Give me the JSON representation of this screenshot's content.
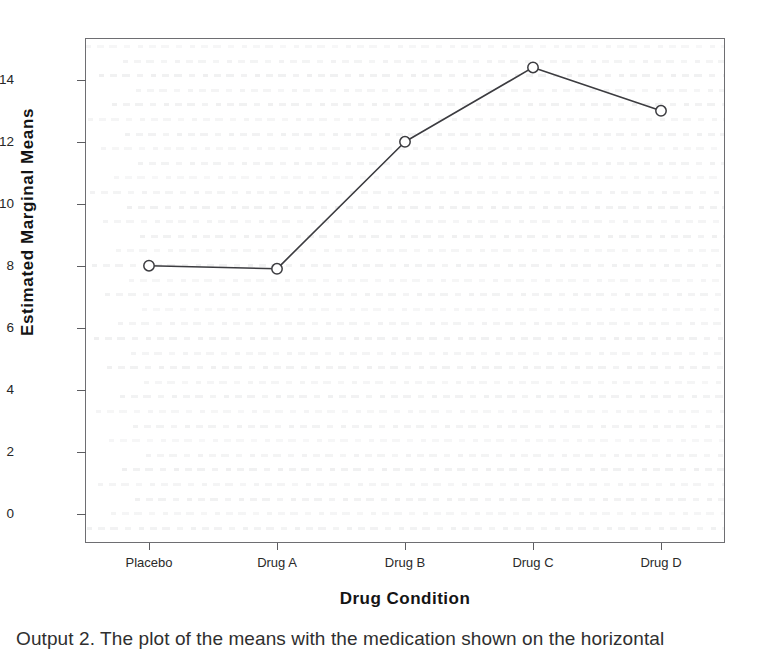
{
  "chart_data": {
    "type": "line",
    "title": "",
    "xlabel": "Drug Condition",
    "ylabel": "Estimated Marginal Means",
    "categories": [
      "Placebo",
      "Drug A",
      "Drug B",
      "Drug C",
      "Drug D"
    ],
    "values": [
      8.0,
      7.9,
      12.0,
      14.4,
      13.0
    ],
    "series": [
      {
        "name": "Estimated Marginal Means",
        "values": [
          8.0,
          7.9,
          12.0,
          14.4,
          13.0
        ]
      }
    ],
    "yticks": [
      0,
      2,
      4,
      6,
      8,
      10,
      12,
      14
    ],
    "ytick_labels": [
      "0",
      "2",
      "4",
      "6",
      "8",
      "10",
      "12",
      "14"
    ],
    "ylim": [
      -0.95,
      15.35
    ],
    "xlim": [
      -0.5,
      4.5
    ],
    "grid": false,
    "legend": "none",
    "marker": "open-circle",
    "line_color": "#3c3c40",
    "marker_color": "#3c3c40",
    "frame_color": "#6e6e72"
  },
  "axes": {
    "y_title": "Estimated Marginal Means",
    "x_title": "Drug Condition"
  },
  "caption": {
    "text": "Output 2.  The plot of the means with the medication shown on the horizontal"
  }
}
